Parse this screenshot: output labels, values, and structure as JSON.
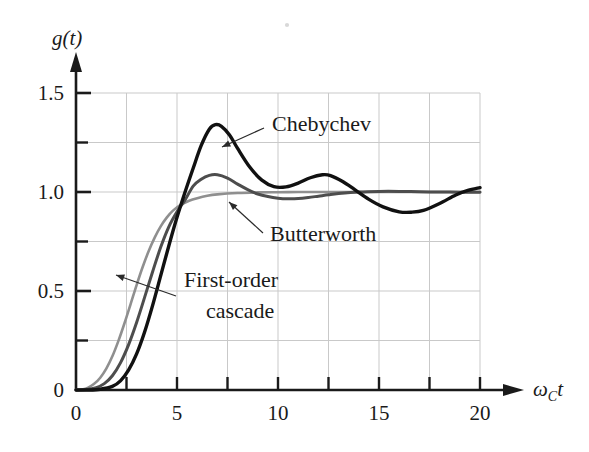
{
  "figure": {
    "name": "step-response-comparison",
    "background": "#ffffff"
  },
  "chart_data": {
    "type": "line",
    "title": "",
    "subtitle": "",
    "xlabel": "ω_C t",
    "xlabel_parts": {
      "omega": "ω",
      "subscript": "C",
      "variable": "t"
    },
    "ylabel": "g(t)",
    "ylabel_parts": {
      "function": "g",
      "open": "(",
      "variable": "t",
      "close": ")"
    },
    "xlim": [
      0,
      20
    ],
    "ylim": [
      0,
      1.5
    ],
    "grid": true,
    "grid_color": "#c9c9c9",
    "legend_position": "inline-annotations",
    "xticks": [
      0,
      5,
      10,
      15,
      20
    ],
    "xtick_labels": [
      "0",
      "5",
      "10",
      "15",
      "20"
    ],
    "xminor_ticks": [
      2.5,
      7.5,
      12.5,
      17.5
    ],
    "yticks": [
      0,
      0.5,
      1.0,
      1.5
    ],
    "ytick_labels": [
      "0",
      "0.5",
      "1.0",
      "1.5"
    ],
    "yminor_ticks": [
      0.25,
      0.75,
      1.25
    ],
    "series": [
      {
        "name": "First-order cascade",
        "color": "#8f8f8f",
        "linewidth": 2.6,
        "label_lines": [
          "First-order",
          "cascade"
        ],
        "x": [
          0.0,
          0.3,
          0.6,
          0.9,
          1.2,
          1.5,
          1.8,
          2.1,
          2.4,
          2.7,
          3.0,
          3.3,
          3.6,
          3.9,
          4.2,
          4.5,
          4.8,
          5.2,
          5.6,
          6.0,
          6.5,
          7.0,
          8.0,
          9.0,
          10.0,
          11.0,
          12.0,
          13.0,
          14.0,
          15.0,
          16.0,
          17.0,
          18.0,
          19.0,
          20.0
        ],
        "y": [
          0.0,
          0.003,
          0.012,
          0.031,
          0.062,
          0.108,
          0.17,
          0.248,
          0.337,
          0.433,
          0.53,
          0.621,
          0.702,
          0.771,
          0.828,
          0.872,
          0.906,
          0.936,
          0.956,
          0.969,
          0.981,
          0.988,
          0.995,
          0.998,
          0.999,
          1.0,
          1.0,
          1.0,
          1.0,
          1.0,
          1.0,
          1.0,
          1.0,
          1.0,
          1.0
        ]
      },
      {
        "name": "Butterworth",
        "color": "#4d4d4d",
        "linewidth": 3.0,
        "label_lines": [
          "Butterworth"
        ],
        "x": [
          0.0,
          0.5,
          1.0,
          1.4,
          1.8,
          2.2,
          2.6,
          3.0,
          3.4,
          3.8,
          4.2,
          4.6,
          5.0,
          5.4,
          5.8,
          6.2,
          6.6,
          7.0,
          7.5,
          8.0,
          8.5,
          9.0,
          9.5,
          10.0,
          10.5,
          11.0,
          11.5,
          12.0,
          12.5,
          13.0,
          14.0,
          15.0,
          16.0,
          17.0,
          18.0,
          19.0,
          20.0
        ],
        "y": [
          0.0,
          0.002,
          0.012,
          0.032,
          0.072,
          0.137,
          0.228,
          0.341,
          0.469,
          0.6,
          0.723,
          0.825,
          0.9,
          0.96,
          1.03,
          1.065,
          1.084,
          1.087,
          1.07,
          1.04,
          1.012,
          0.99,
          0.977,
          0.969,
          0.966,
          0.967,
          0.972,
          0.979,
          0.986,
          0.992,
          1.0,
          1.003,
          1.003,
          1.001,
          1.0,
          0.999,
          0.999
        ]
      },
      {
        "name": "Chebychev",
        "color": "#111111",
        "linewidth": 3.4,
        "label_lines": [
          "Chebychev"
        ],
        "x": [
          0.0,
          0.6,
          1.2,
          1.8,
          2.2,
          2.6,
          3.0,
          3.4,
          3.8,
          4.2,
          4.6,
          5.0,
          5.4,
          5.8,
          6.2,
          6.6,
          6.9,
          7.2,
          7.6,
          8.0,
          8.6,
          9.2,
          9.8,
          10.4,
          11.0,
          11.6,
          12.2,
          12.6,
          13.2,
          13.8,
          14.5,
          15.2,
          16.0,
          16.6,
          17.2,
          18.0,
          18.8,
          19.4,
          20.0
        ],
        "y": [
          0.0,
          0.0,
          0.004,
          0.018,
          0.046,
          0.1,
          0.182,
          0.294,
          0.43,
          0.58,
          0.73,
          0.872,
          1.0,
          1.12,
          1.235,
          1.317,
          1.34,
          1.332,
          1.288,
          1.22,
          1.126,
          1.06,
          1.027,
          1.026,
          1.045,
          1.072,
          1.087,
          1.083,
          1.053,
          1.012,
          0.963,
          0.925,
          0.9,
          0.898,
          0.907,
          0.942,
          0.985,
          1.008,
          1.022
        ]
      }
    ],
    "annotations": [
      {
        "name": "chebychev-label",
        "text": "Chebychev",
        "text_x": 272,
        "text_y": 131,
        "leader": {
          "x1": 264,
          "y1": 128,
          "x2": 222,
          "y2": 147
        }
      },
      {
        "name": "butterworth-label",
        "text": "Butterworth",
        "text_x": 270,
        "text_y": 241,
        "leader": {
          "x1": 263,
          "y1": 233,
          "x2": 229,
          "y2": 202
        }
      },
      {
        "name": "first-order-cascade-label",
        "text_line1": "First-order",
        "text_line2": "cascade",
        "text_x": 184,
        "text_y": 287,
        "text_y2": 318,
        "leader": {
          "x1": 176,
          "y1": 296,
          "x2": 116,
          "y2": 275
        }
      }
    ]
  }
}
